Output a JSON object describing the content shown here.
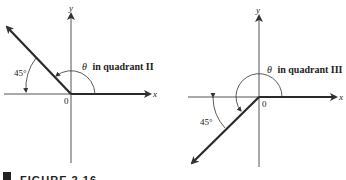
{
  "figures": [
    {
      "id": "left",
      "angle_label": "θ in quadrant II",
      "theta_symbol": "θ",
      "angle_text": "in quadrant II",
      "reference_angle": "45°",
      "origin_label": "0",
      "x_label": "x",
      "y_label": "y"
    },
    {
      "id": "right",
      "angle_label": "θ in quadrant III",
      "theta_symbol": "θ",
      "angle_text": "in quadrant III",
      "reference_angle": "45°",
      "origin_label": "0",
      "x_label": "x",
      "y_label": "y"
    }
  ],
  "caption": "FIGURE 2.16",
  "colors": {
    "axis": "#333333",
    "ray": "#2a2a2a",
    "text": "#222222"
  }
}
